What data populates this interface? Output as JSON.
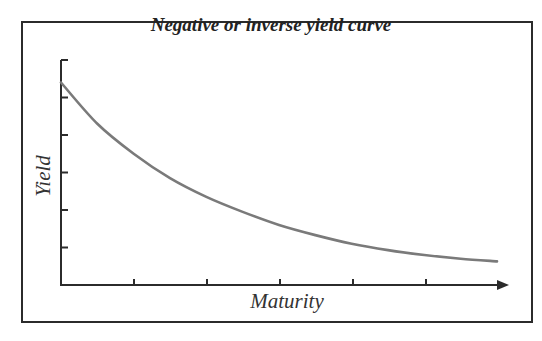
{
  "chart_data": {
    "type": "line",
    "title": "Negative or inverse yield curve",
    "xlabel": "Maturity",
    "ylabel": "Yield",
    "grid": false,
    "legend": null,
    "x_ticks": 6,
    "y_ticks": 6,
    "x": [
      0,
      0.5,
      1,
      1.5,
      2,
      2.5,
      3,
      3.5,
      4,
      4.5,
      5,
      5.5,
      6
    ],
    "series": [
      {
        "name": "Yield curve",
        "color": "#7a7a7a",
        "values": [
          5.4,
          4.3,
          3.5,
          2.85,
          2.35,
          1.95,
          1.6,
          1.33,
          1.1,
          0.93,
          0.8,
          0.7,
          0.63
        ]
      }
    ],
    "xlim": [
      0,
      6.2
    ],
    "ylim": [
      0,
      6
    ]
  },
  "colors": {
    "axis": "#2b2b2b",
    "curve": "#7a7a7a",
    "frame": "#2b2b2b"
  }
}
